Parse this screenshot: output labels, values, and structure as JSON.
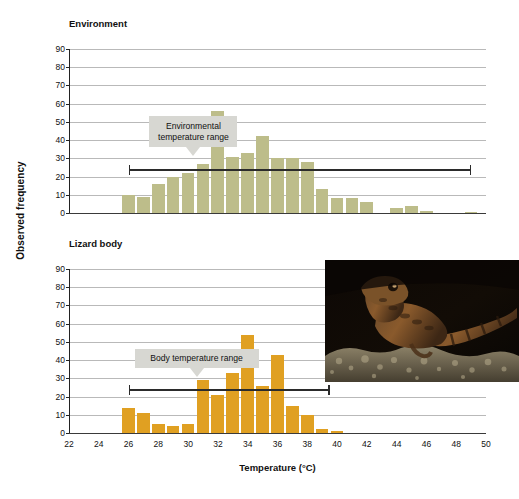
{
  "figure": {
    "y_axis_label": "Observed frequency",
    "x_axis_label": "Temperature (°C)",
    "colors": {
      "environment_bar": "#bdbd8a",
      "body_bar": "#e0a022",
      "callout_bg": "#d7d7d2",
      "gridline": "#b9b9b9",
      "axis": "#2b2b2b"
    }
  },
  "panels": [
    {
      "id": "environment",
      "title": "Environment",
      "callout": "Environmental temperature range",
      "range_label": "Environmental temperature range",
      "range_min": 26,
      "range_max": 49
    },
    {
      "id": "lizard-body",
      "title": "Lizard body",
      "callout": "Body temperature range",
      "range_label": "Body temperature range",
      "range_min": 26,
      "range_max": 39.5
    }
  ],
  "inset": {
    "caption": "lizard-photograph",
    "alt": "Photograph of a lizard on rocky ground at night"
  },
  "chart_data": [
    {
      "type": "bar",
      "title": "Environment",
      "xlabel": "Temperature (°C)",
      "ylabel": "Observed frequency",
      "xlim": [
        22,
        50
      ],
      "ylim": [
        0,
        90
      ],
      "ytick_labels": [
        "0",
        "10",
        "20",
        "30",
        "40",
        "50",
        "60",
        "70",
        "80",
        "90"
      ],
      "xtick_labels": [
        "22",
        "24",
        "26",
        "28",
        "30",
        "32",
        "34",
        "36",
        "38",
        "40",
        "42",
        "44",
        "46",
        "48",
        "50"
      ],
      "grid": true,
      "bin_width": 1,
      "series_color": "#bdbd8a",
      "annotation": "Environmental temperature range",
      "annotation_range": [
        26,
        49
      ],
      "x": [
        26,
        27,
        28,
        29,
        30,
        31,
        32,
        33,
        34,
        35,
        36,
        37,
        38,
        39,
        40,
        41,
        42,
        43,
        44,
        45,
        46,
        49
      ],
      "values": [
        10,
        9,
        16,
        20,
        22,
        27,
        56,
        31,
        33,
        42,
        30,
        30,
        28,
        13,
        8,
        8,
        6,
        0,
        3,
        4,
        1,
        0.5
      ]
    },
    {
      "type": "bar",
      "title": "Lizard body",
      "xlabel": "Temperature (°C)",
      "ylabel": "Observed frequency",
      "xlim": [
        22,
        50
      ],
      "ylim": [
        0,
        90
      ],
      "ytick_labels": [
        "0",
        "10",
        "20",
        "30",
        "40",
        "50",
        "60",
        "70",
        "80",
        "90"
      ],
      "xtick_labels": [
        "22",
        "24",
        "26",
        "28",
        "30",
        "32",
        "34",
        "36",
        "38",
        "40",
        "42",
        "44",
        "46",
        "48",
        "50"
      ],
      "grid": true,
      "bin_width": 1,
      "series_color": "#e0a022",
      "annotation": "Body temperature range",
      "annotation_range": [
        26,
        39.5
      ],
      "x": [
        26,
        27,
        28,
        29,
        30,
        31,
        32,
        33,
        34,
        35,
        36,
        37,
        38,
        39,
        40
      ],
      "values": [
        14,
        11,
        5,
        4,
        5,
        29,
        21,
        33,
        54,
        26,
        43,
        15,
        10,
        2,
        1
      ]
    }
  ]
}
